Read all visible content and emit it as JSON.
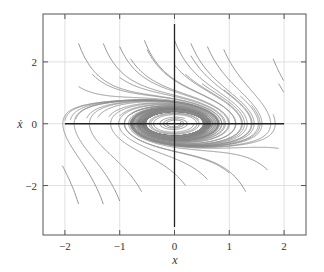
{
  "chart_data": {
    "type": "line",
    "title": "",
    "subtitle": "Phase portrait with stable limit cycle",
    "xlabel": "x",
    "ylabel": "ẋ",
    "xlim": [
      -2.4,
      2.4
    ],
    "ylim": [
      -3.6,
      3.55
    ],
    "xticks": [
      -2,
      -1,
      0,
      1,
      2
    ],
    "xtick_labels": [
      "−2",
      "−1",
      "0",
      "1",
      "2"
    ],
    "yticks": [
      -2,
      0,
      2
    ],
    "ytick_labels": [
      "−2",
      "0",
      "2"
    ],
    "grid": true,
    "grid_color": "#d9d9d9",
    "axes_lines": {
      "x0": true,
      "y0": true,
      "color": "#222222"
    },
    "trajectory_color": "#8c8c8c",
    "frame_color": "#555555",
    "legend": null,
    "limit_cycle": {
      "x_amplitude": 0.75,
      "y_amplitude": 0.55,
      "center": [
        0,
        0
      ]
    },
    "system": {
      "mu": 0.35,
      "a": 0.5,
      "description": "van-der-pol-like oscillator, trajectories converge to limit cycle"
    },
    "initial_conditions": [
      [
        -1.75,
        2.6
      ],
      [
        -1.3,
        2.6
      ],
      [
        -1.0,
        2.5
      ],
      [
        -0.55,
        2.7
      ],
      [
        -0.5,
        2.4
      ],
      [
        -0.8,
        2.1
      ],
      [
        -1.5,
        1.6
      ],
      [
        -1.75,
        1.2
      ],
      [
        -1.0,
        1.5
      ],
      [
        -2.0,
        0.1
      ],
      [
        -1.9,
        0.12
      ],
      [
        -1.8,
        0.15
      ],
      [
        -1.6,
        0.18
      ],
      [
        -1.4,
        0.2
      ],
      [
        -1.2,
        0.22
      ],
      [
        -1.0,
        0.25
      ],
      [
        -0.8,
        0.3
      ],
      [
        0.0,
        2.7
      ],
      [
        0.3,
        2.6
      ],
      [
        0.6,
        2.5
      ],
      [
        0.9,
        2.4
      ],
      [
        0.3,
        2.2
      ],
      [
        0.0,
        1.9
      ],
      [
        0.2,
        1.6
      ],
      [
        0.5,
        1.3
      ],
      [
        0.9,
        1.1
      ],
      [
        1.2,
        0.9
      ],
      [
        1.4,
        0.6
      ],
      [
        0.1,
        0.05
      ],
      [
        0.35,
        0.02
      ],
      [
        -1.75,
        -2.6
      ],
      [
        -1.3,
        -2.6
      ],
      [
        -1.0,
        -2.5
      ],
      [
        -0.6,
        -2.2
      ],
      [
        0.2,
        -2.0
      ],
      [
        0.6,
        -1.8
      ],
      [
        1.0,
        -1.6
      ],
      [
        1.3,
        -2.2
      ],
      [
        1.7,
        -1.5
      ],
      [
        1.9,
        -0.8
      ],
      [
        1.8,
        0.3
      ],
      [
        1.9,
        1.3
      ],
      [
        1.8,
        2.1
      ]
    ]
  }
}
